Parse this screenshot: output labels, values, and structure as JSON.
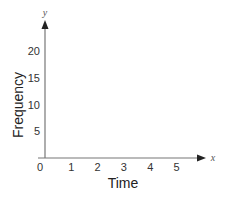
{
  "chart_data": {
    "type": "line",
    "title": "",
    "xlabel": "Time",
    "ylabel": "Frequency",
    "x_axis_var": "x",
    "y_axis_var": "y",
    "x_ticks": [
      "0",
      "1",
      "2",
      "3",
      "4",
      "5"
    ],
    "y_ticks": [
      "5",
      "10",
      "15",
      "20"
    ],
    "xlim": [
      0,
      6.2
    ],
    "ylim": [
      0,
      25.5
    ],
    "series": [],
    "grid": false,
    "legend": "none",
    "colors": {
      "axis": "#777777",
      "arrow": "#222222",
      "text": "#333333"
    }
  }
}
